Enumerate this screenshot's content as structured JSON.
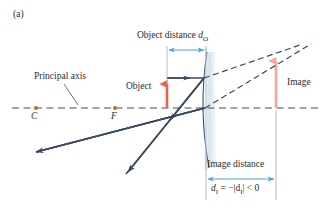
{
  "figure": {
    "panel_label": "(a)",
    "type": "convex-mirror-ray-diagram",
    "background": "#ffffff"
  },
  "labels": {
    "principal_axis": "Principal axis",
    "object": "Object",
    "image": "Image",
    "center_of_curvature": "C",
    "focal_point": "F",
    "object_distance_text": "Object distance",
    "object_distance_symbol": "d",
    "object_distance_subscript": "O",
    "image_distance_text": "Image distance",
    "image_distance_formula_symbol": "d",
    "image_distance_formula_subscript": "I",
    "image_distance_formula_rest": " = −|d",
    "image_distance_formula_subscript2": "I",
    "image_distance_formula_tail": "| < 0"
  },
  "colors": {
    "text": "#2b2b33",
    "ray": "#3b4a63",
    "axis_dashed": "#4a4a52",
    "object_arrow": "#f0604c",
    "image_arrow": "#f4a79b",
    "point_marker": "#e8563f",
    "dimension_blue": "#4aa3d8",
    "mirror_line": "#46505f",
    "mirror_fill": "#d6e6ef",
    "extension_dashed": "#3b4a63",
    "leader_line": "#4a4a52",
    "tick_gray": "#9aa0a8"
  },
  "geometry": {
    "principal_axis_y": 108,
    "mirror_vertex_x": 205,
    "center_of_curvature_x": 36,
    "focal_point_x": 115,
    "object_base_x": 167,
    "object_top_y": 78,
    "image_base_x": 276,
    "image_top_y": 55,
    "object_distance_span": [
      167,
      205
    ],
    "image_distance_span": [
      205,
      276
    ]
  }
}
